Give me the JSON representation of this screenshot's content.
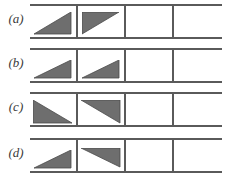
{
  "figure": {
    "name": "triangle-grid-figure",
    "background_color": "#ffffff",
    "line_color": "#5a5a5a",
    "triangle_fill": "#6e6e6e",
    "triangle_stroke": "#4a4a4a",
    "columns_per_row": 4,
    "rows": [
      {
        "label": "(a)",
        "cells": [
          {
            "shape": "right-triangle",
            "right_angle": "bottom-right",
            "filled": true
          },
          {
            "shape": "right-triangle",
            "right_angle": "top-left",
            "filled": true
          },
          {
            "shape": "empty",
            "right_angle": "",
            "filled": false
          },
          {
            "shape": "empty",
            "right_angle": "",
            "filled": false
          }
        ]
      },
      {
        "label": "(b)",
        "cells": [
          {
            "shape": "right-triangle",
            "right_angle": "bottom-right",
            "filled": true
          },
          {
            "shape": "right-triangle",
            "right_angle": "bottom-right",
            "filled": true
          },
          {
            "shape": "empty",
            "right_angle": "",
            "filled": false
          },
          {
            "shape": "empty",
            "right_angle": "",
            "filled": false
          }
        ]
      },
      {
        "label": "(c)",
        "cells": [
          {
            "shape": "right-triangle",
            "right_angle": "bottom-left",
            "filled": true
          },
          {
            "shape": "right-triangle",
            "right_angle": "top-right",
            "filled": true
          },
          {
            "shape": "empty",
            "right_angle": "",
            "filled": false
          },
          {
            "shape": "empty",
            "right_angle": "",
            "filled": false
          }
        ]
      },
      {
        "label": "(d)",
        "cells": [
          {
            "shape": "right-triangle",
            "right_angle": "bottom-right",
            "filled": true
          },
          {
            "shape": "right-triangle",
            "right_angle": "top-right",
            "filled": true
          },
          {
            "shape": "empty",
            "right_angle": "",
            "filled": false
          },
          {
            "shape": "empty",
            "right_angle": "",
            "filled": false
          }
        ]
      }
    ]
  }
}
